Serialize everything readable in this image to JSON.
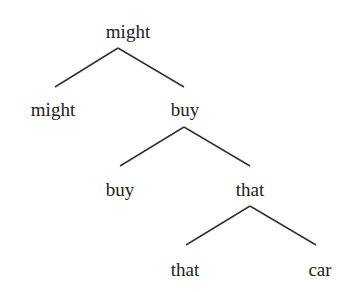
{
  "tree": {
    "root": "might",
    "nodes": [
      {
        "label": "might",
        "x": 128,
        "y": 22
      },
      {
        "label": "might",
        "x": 53,
        "y": 100
      },
      {
        "label": "buy",
        "x": 185,
        "y": 100
      },
      {
        "label": "buy",
        "x": 120,
        "y": 180
      },
      {
        "label": "that",
        "x": 250,
        "y": 180
      },
      {
        "label": "that",
        "x": 185,
        "y": 260
      },
      {
        "label": "car",
        "x": 320,
        "y": 260
      }
    ],
    "edges": [
      {
        "from": "might (root)",
        "to": "might"
      },
      {
        "from": "might (root)",
        "to": "buy"
      },
      {
        "from": "buy",
        "to": "buy"
      },
      {
        "from": "buy",
        "to": "that"
      },
      {
        "from": "that",
        "to": "that"
      },
      {
        "from": "that",
        "to": "car"
      }
    ]
  }
}
